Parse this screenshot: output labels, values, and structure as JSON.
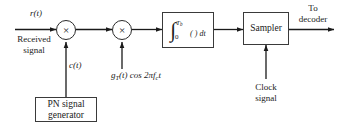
{
  "diagram": {
    "stroke_color": "#2a2a2a",
    "background": "#ffffff",
    "input": {
      "signal_label": "r(t)",
      "description_line1": "Received",
      "description_line2": "signal"
    },
    "multiplier1": {
      "glyph": "×",
      "name": "multiplier"
    },
    "multiplier2": {
      "glyph": "×",
      "name": "multiplier"
    },
    "pn_code_label": "c(t)",
    "pn_block": {
      "line1": "PN signal",
      "line2": "generator"
    },
    "carrier_label": {
      "g": "g",
      "g_sub": "T",
      "g_arg": "(t) cos 2πf",
      "f_sub": "c",
      "tail": "t",
      "full": "g_T(t) cos 2πf_c t"
    },
    "integrator": {
      "symbol": "∫",
      "upper_limit": "T",
      "upper_limit_sub": "b",
      "lower_limit": "0",
      "integrand": "( ) dt"
    },
    "sampler": {
      "label": "Sampler"
    },
    "clock": {
      "line1": "Clock",
      "line2": "signal"
    },
    "output": {
      "line1": "To",
      "line2": "decoder"
    }
  }
}
